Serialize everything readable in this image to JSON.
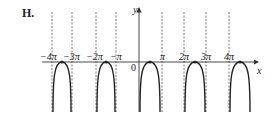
{
  "figure": {
    "label": "H.",
    "x_axis_label": "x",
    "y_axis_label": "y",
    "origin_label": "0",
    "tick_labels": [
      "−4π",
      "−3π",
      "−2π",
      "−π",
      "π",
      "2π",
      "3π",
      "4π"
    ],
    "asymptote_note": "vertical dashed asymptotes at x = −4π, −3π, −2π, −π, π, 2π, 3π, 4π",
    "curve_color": "#222222",
    "axis_color": "#333333"
  }
}
